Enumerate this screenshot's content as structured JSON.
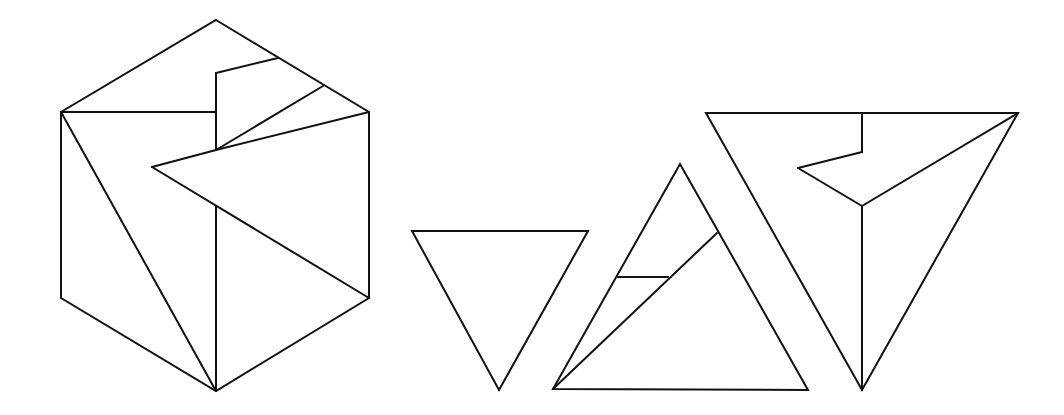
{
  "diagram": {
    "stroke_color": "#111111",
    "background_color": "#ffffff",
    "figures": [
      {
        "name": "hexagon",
        "outline": [
          [
            216,
            20
          ],
          [
            369,
            112
          ],
          [
            369,
            298
          ],
          [
            216,
            391
          ],
          [
            61,
            298
          ],
          [
            61,
            112
          ]
        ],
        "inner_lines": [
          [
            [
              61,
              112
            ],
            [
              216,
              112
            ]
          ],
          [
            [
              216,
              73
            ],
            [
              216,
              150
            ]
          ],
          [
            [
              216,
              73
            ],
            [
              278,
              58
            ]
          ],
          [
            [
              216,
              150
            ],
            [
              323,
              86
            ]
          ],
          [
            [
              216,
              150
            ],
            [
              369,
              112
            ]
          ],
          [
            [
              216,
              150
            ],
            [
              152,
              167
            ]
          ],
          [
            [
              152,
              167
            ],
            [
              369,
              298
            ]
          ],
          [
            [
              216,
              206
            ],
            [
              216,
              391
            ]
          ],
          [
            [
              61,
              112
            ],
            [
              216,
              391
            ]
          ]
        ]
      },
      {
        "name": "small-inverted-triangle",
        "outline": [
          [
            412,
            231
          ],
          [
            588,
            231
          ],
          [
            499,
            390
          ]
        ],
        "inner_lines": []
      },
      {
        "name": "middle-upright-triangle",
        "outline": [
          [
            680,
            164
          ],
          [
            808,
            390
          ],
          [
            553,
            389
          ]
        ],
        "inner_lines": [
          [
            [
              553,
              389
            ],
            [
              717,
              233
            ]
          ],
          [
            [
              618,
              277
            ],
            [
              668,
              277
            ]
          ]
        ]
      },
      {
        "name": "large-inverted-triangle",
        "outline": [
          [
            706,
            113
          ],
          [
            1018,
            113
          ],
          [
            862,
            390
          ]
        ],
        "inner_lines": [
          [
            [
              862,
              113
            ],
            [
              862,
              152
            ]
          ],
          [
            [
              862,
              152
            ],
            [
              798,
              168
            ]
          ],
          [
            [
              798,
              168
            ],
            [
              862,
              206
            ]
          ],
          [
            [
              862,
              206
            ],
            [
              1018,
              113
            ]
          ],
          [
            [
              862,
              206
            ],
            [
              862,
              390
            ]
          ]
        ]
      }
    ]
  }
}
